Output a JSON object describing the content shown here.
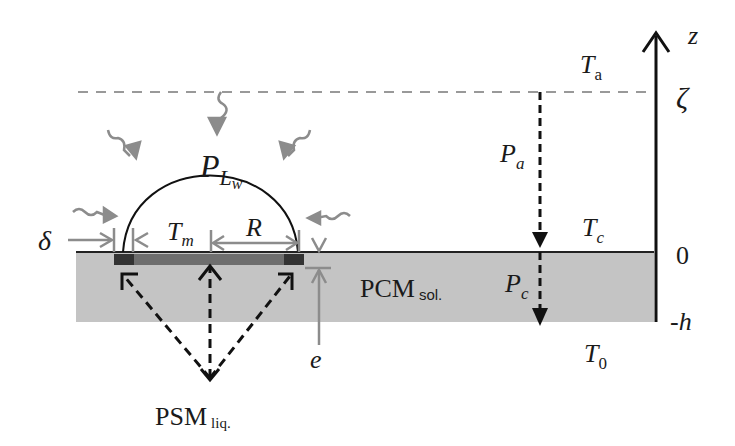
{
  "diagram": {
    "type": "schematic",
    "colors": {
      "pcm_layer": "#c4c4c4",
      "heater_bar": "#6e6e6e",
      "heater_ends": "#333333",
      "gray_arrows": "#8c8c8c",
      "axis": "#111111",
      "dashed_level": "#999999"
    },
    "labels": {
      "axis_z": "z",
      "zeta": "ζ",
      "zero": "0",
      "minus_h": "-h",
      "T_a": "T",
      "T_a_sub": "a",
      "T_c": "T",
      "T_c_sub": "c",
      "T_0": "T",
      "T_0_sub": "0",
      "P_a": "P",
      "P_a_sub": "a",
      "P_c": "P",
      "P_c_sub": "c",
      "P_Lw": "P",
      "P_Lw_sub": "L",
      "P_Lw_subsub": "w",
      "T_m": "T",
      "T_m_sub": "m",
      "R": "R",
      "delta": "δ",
      "e": "e",
      "PCM": "PCM",
      "PCM_sub": "sol.",
      "PSM": "PSM",
      "PSM_sub": "liq."
    }
  }
}
